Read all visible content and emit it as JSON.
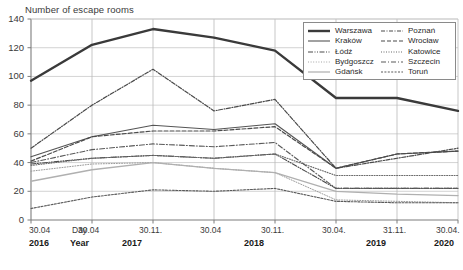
{
  "chart_data": {
    "type": "line",
    "title": "Number of escape rooms",
    "xlabel": "",
    "ylabel": "Number of escape rooms",
    "ylim": [
      0,
      140
    ],
    "yticks": [
      0,
      20,
      40,
      60,
      80,
      100,
      120,
      140
    ],
    "grid": true,
    "legend_position": "top-right",
    "x_axis_row_labels": {
      "day": "Day",
      "year": "Year"
    },
    "categories": [
      "30.04.2016",
      "30.04.2017",
      "30.11.2017",
      "30.04.2018",
      "30.11.2018",
      "30.04.2019",
      "31.11.2019",
      "30.04.2020"
    ],
    "x_day_labels": [
      "30.04",
      "30.04",
      "30.11.",
      "30.04",
      "30.11.",
      "30.04.",
      "31.11.",
      "30.04."
    ],
    "x_year_labels": [
      "2016",
      "2017",
      "",
      "2018",
      "",
      "2019",
      "",
      "2020"
    ],
    "series": [
      {
        "name": "Warszawa",
        "values": [
          97,
          122,
          133,
          127,
          118,
          85,
          85,
          76
        ],
        "style": "solid-thick",
        "color": "#3a3a3a"
      },
      {
        "name": "Kraków",
        "values": [
          44,
          58,
          66,
          63,
          67,
          36,
          46,
          48
        ],
        "style": "solid-thin",
        "color": "#555555"
      },
      {
        "name": "Łódź",
        "values": [
          39,
          43,
          45,
          43,
          46,
          22,
          22,
          22
        ],
        "style": "dash-dot-dot",
        "color": "#4a4a4a"
      },
      {
        "name": "Bydgoszcz",
        "values": [
          34,
          39,
          40,
          36,
          33,
          14,
          13,
          12
        ],
        "style": "dotted-fine",
        "color": "#9a9a9a"
      },
      {
        "name": "Gdańsk",
        "values": [
          27,
          35,
          40,
          36,
          33,
          20,
          18,
          17
        ],
        "style": "solid-light",
        "color": "#b0b0b0"
      },
      {
        "name": "Poznań",
        "values": [
          50,
          80,
          105,
          76,
          84,
          36,
          43,
          50
        ],
        "style": "dash-dot",
        "color": "#4a4a4a"
      },
      {
        "name": "Wrocław",
        "values": [
          41,
          58,
          62,
          62,
          65,
          36,
          46,
          48
        ],
        "style": "dashed",
        "color": "#4a4a4a"
      },
      {
        "name": "Katowice",
        "values": [
          38,
          43,
          45,
          43,
          46,
          31,
          31,
          31
        ],
        "style": "dotted",
        "color": "#6a6a6a"
      },
      {
        "name": "Szczecin",
        "values": [
          40,
          49,
          53,
          51,
          54,
          22,
          22,
          22
        ],
        "style": "dash-dot-long",
        "color": "#5a5a5a"
      },
      {
        "name": "Toruń",
        "values": [
          8,
          16,
          21,
          20,
          22,
          13,
          12,
          12
        ],
        "style": "dotted-dash",
        "color": "#5a5a5a"
      }
    ]
  },
  "legend": {
    "col1": [
      "Warszawa",
      "Kraków",
      "Łódź",
      "Bydgoszcz",
      "Gdańsk"
    ],
    "col2": [
      "Poznań",
      "Wrocław",
      "Katowice",
      "Szczecin",
      "Toruń"
    ]
  }
}
